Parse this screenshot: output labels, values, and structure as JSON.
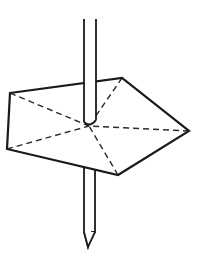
{
  "figure": {
    "colors": {
      "line": "#1a1a1a",
      "background": "#ffffff"
    },
    "shape": {
      "vertices": [
        [
          10,
          93
        ],
        [
          122,
          78
        ],
        [
          189,
          131
        ],
        [
          118,
          175
        ],
        [
          7,
          149
        ]
      ],
      "center": [
        89,
        126
      ]
    },
    "pin": {
      "top": [
        [
          84,
          19
        ],
        [
          96,
          19
        ]
      ],
      "tip": [
        88,
        247
      ]
    }
  }
}
